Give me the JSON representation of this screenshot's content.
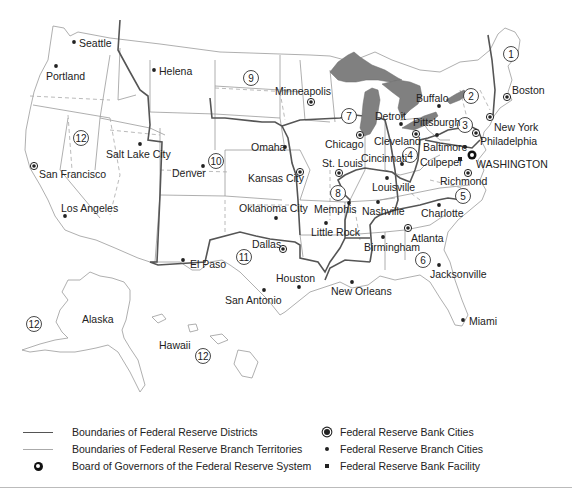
{
  "map": {
    "title": "Federal Reserve System Districts",
    "districts": [
      {
        "number": "1",
        "x": 511,
        "y": 54
      },
      {
        "number": "2",
        "x": 471,
        "y": 96
      },
      {
        "number": "3",
        "x": 465,
        "y": 125
      },
      {
        "number": "4",
        "x": 410,
        "y": 155
      },
      {
        "number": "5",
        "x": 463,
        "y": 196
      },
      {
        "number": "6",
        "x": 423,
        "y": 260
      },
      {
        "number": "7",
        "x": 349,
        "y": 116
      },
      {
        "number": "8",
        "x": 338,
        "y": 193
      },
      {
        "number": "9",
        "x": 251,
        "y": 78
      },
      {
        "number": "10",
        "x": 216,
        "y": 161
      },
      {
        "number": "11",
        "x": 244,
        "y": 257
      },
      {
        "number": "12",
        "x": 81,
        "y": 138
      },
      {
        "number": "12",
        "x": 34,
        "y": 324
      },
      {
        "number": "12",
        "x": 203,
        "y": 356
      }
    ],
    "cities": [
      {
        "name": "Seattle",
        "type": "branch",
        "x": 74,
        "y": 42,
        "lx": 79,
        "ly": 47
      },
      {
        "name": "Portland",
        "type": "branch",
        "x": 56,
        "y": 66,
        "lx": 46,
        "ly": 80
      },
      {
        "name": "Helena",
        "type": "branch",
        "x": 154,
        "y": 70,
        "lx": 159,
        "ly": 75
      },
      {
        "name": "Minneapolis",
        "type": "bank",
        "x": 311,
        "y": 102,
        "lx": 275,
        "ly": 95
      },
      {
        "name": "Salt Lake City",
        "type": "branch",
        "x": 140,
        "y": 144,
        "lx": 106,
        "ly": 158
      },
      {
        "name": "San Francisco",
        "type": "bank",
        "x": 34,
        "y": 166,
        "lx": 39,
        "ly": 178
      },
      {
        "name": "Los Angeles",
        "type": "branch",
        "x": 65,
        "y": 216,
        "lx": 61,
        "ly": 212
      },
      {
        "name": "Denver",
        "type": "branch",
        "x": 203,
        "y": 166,
        "lx": 172,
        "ly": 177
      },
      {
        "name": "Omaha",
        "type": "branch",
        "x": 285,
        "y": 147,
        "lx": 251,
        "ly": 151
      },
      {
        "name": "Kansas City",
        "type": "bank",
        "x": 300,
        "y": 172,
        "lx": 248,
        "ly": 182
      },
      {
        "name": "Oklahoma City",
        "type": "branch",
        "x": 276,
        "y": 218,
        "lx": 239,
        "ly": 212
      },
      {
        "name": "Dallas",
        "type": "bank",
        "x": 283,
        "y": 249,
        "lx": 252,
        "ly": 248
      },
      {
        "name": "El Paso",
        "type": "branch",
        "x": 183,
        "y": 260,
        "lx": 190,
        "ly": 268
      },
      {
        "name": "San Antonio",
        "type": "branch",
        "x": 264,
        "y": 290,
        "lx": 225,
        "ly": 304
      },
      {
        "name": "Houston",
        "type": "branch",
        "x": 299,
        "y": 287,
        "lx": 276,
        "ly": 282
      },
      {
        "name": "Chicago",
        "type": "bank",
        "x": 360,
        "y": 135,
        "lx": 325,
        "ly": 148
      },
      {
        "name": "Detroit",
        "type": "branch",
        "x": 401,
        "y": 124,
        "lx": 375,
        "ly": 120
      },
      {
        "name": "St. Louis",
        "type": "bank",
        "x": 339,
        "y": 173,
        "lx": 322,
        "ly": 167
      },
      {
        "name": "Memphis",
        "type": "branch",
        "x": 349,
        "y": 203,
        "lx": 314,
        "ly": 213
      },
      {
        "name": "Little Rock",
        "type": "branch",
        "x": 326,
        "y": 223,
        "lx": 311,
        "ly": 236
      },
      {
        "name": "Cleveland",
        "type": "bank",
        "x": 416,
        "y": 134,
        "lx": 374,
        "ly": 145
      },
      {
        "name": "Cincinnati",
        "type": "branch",
        "x": 402,
        "y": 164,
        "lx": 361,
        "ly": 162
      },
      {
        "name": "Louisville",
        "type": "branch",
        "x": 387,
        "y": 178,
        "lx": 372,
        "ly": 191
      },
      {
        "name": "Nashville",
        "type": "branch",
        "x": 378,
        "y": 202,
        "lx": 362,
        "ly": 215
      },
      {
        "name": "Birmingham",
        "type": "branch",
        "x": 383,
        "y": 237,
        "lx": 364,
        "ly": 251
      },
      {
        "name": "Atlanta",
        "type": "bank",
        "x": 408,
        "y": 228,
        "lx": 411,
        "ly": 242
      },
      {
        "name": "Jacksonville",
        "type": "branch",
        "x": 439,
        "y": 265,
        "lx": 430,
        "ly": 278
      },
      {
        "name": "Miami",
        "type": "branch",
        "x": 463,
        "y": 320,
        "lx": 469,
        "ly": 325
      },
      {
        "name": "New Orleans",
        "type": "branch",
        "x": 352,
        "y": 282,
        "lx": 331,
        "ly": 295
      },
      {
        "name": "Buffalo",
        "type": "branch",
        "x": 439,
        "y": 106,
        "lx": 416,
        "ly": 102
      },
      {
        "name": "Pittsburgh",
        "type": "branch",
        "x": 437,
        "y": 135,
        "lx": 413,
        "ly": 126
      },
      {
        "name": "Boston",
        "type": "bank",
        "x": 507,
        "y": 97,
        "lx": 512,
        "ly": 94
      },
      {
        "name": "New York",
        "type": "bank",
        "x": 490,
        "y": 117,
        "lx": 494,
        "ly": 131
      },
      {
        "name": "Philadelphia",
        "type": "bank",
        "x": 476,
        "y": 133,
        "lx": 480,
        "ly": 145
      },
      {
        "name": "Baltimore",
        "type": "branch",
        "x": 465,
        "y": 147,
        "lx": 423,
        "ly": 151
      },
      {
        "name": "Culpeper",
        "type": "facility",
        "x": 460,
        "y": 159,
        "lx": 420,
        "ly": 166
      },
      {
        "name": "WASHINGTON",
        "type": "board",
        "x": 472,
        "y": 155,
        "lx": 476,
        "ly": 168
      },
      {
        "name": "Richmond",
        "type": "bank",
        "x": 468,
        "y": 173,
        "lx": 440,
        "ly": 185
      },
      {
        "name": "Charlotte",
        "type": "branch",
        "x": 439,
        "y": 205,
        "lx": 421,
        "ly": 217
      }
    ],
    "region_labels": [
      {
        "name": "Alaska",
        "x": 82,
        "y": 323
      },
      {
        "name": "Hawaii",
        "x": 159,
        "y": 349
      }
    ]
  },
  "legend": {
    "left": [
      {
        "symbol": "district-line",
        "label": "Boundaries of Federal Reserve Districts"
      },
      {
        "symbol": "branch-line",
        "label": "Boundaries of Federal Reserve Branch Territories"
      },
      {
        "symbol": "board-icon",
        "label": "Board of Governors of the Federal Reserve System"
      }
    ],
    "right": [
      {
        "symbol": "bank-city-icon",
        "label": "Federal Reserve Bank Cities"
      },
      {
        "symbol": "branch-city-icon",
        "label": "Federal Reserve Branch Cities"
      },
      {
        "symbol": "facility-icon",
        "label": "Federal Reserve Bank Facility"
      }
    ]
  },
  "colors": {
    "district_line": "#555555",
    "branch_line": "#aaaaaa",
    "lakes": "#808080",
    "text": "#222222"
  }
}
